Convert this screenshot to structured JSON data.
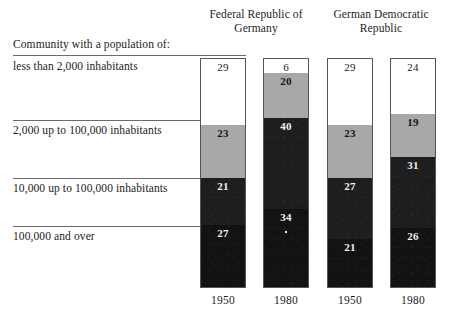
{
  "caption": "Community with a population of:",
  "group_headers": [
    "Federal Republic of\nGermany",
    "German Democratic\nRepublic"
  ],
  "group_headers_flat": [
    "Federal Republic of Germany",
    "German Democratic Republic"
  ],
  "row_labels": [
    "less than 2,000 inhabitants",
    "2,000 up to 100,000 inhabitants",
    "10,000 up to 100,000 inhabitants",
    "100,000 and over"
  ],
  "year_labels": [
    "1950",
    "1980",
    "1950",
    "1980"
  ],
  "colors": {
    "tone_white": "#ffffff",
    "tone_gray": "#a8a8a8",
    "tone_dark": "#1e1e1e",
    "tone_black": "#121212",
    "rule": "#6b6b6b",
    "bar_border": "#555555",
    "text": "#1c1c1c",
    "background": "#ffffff"
  },
  "chart_data": {
    "type": "bar",
    "title": "",
    "subtitle": "",
    "xlabel": "",
    "ylabel": "",
    "ylim": [
      0,
      100
    ],
    "grid": false,
    "legend_position": "row-labels-left",
    "stacked": true,
    "units": "percent",
    "categories": [
      "1950",
      "1980",
      "1950",
      "1980"
    ],
    "group_labels": [
      "Federal Republic of Germany",
      "German Democratic Republic"
    ],
    "group_spans": [
      {
        "label": "Federal Republic of Germany",
        "categories": [
          "1950",
          "1980"
        ]
      },
      {
        "label": "German Democratic Republic",
        "categories": [
          "1950",
          "1980"
        ]
      }
    ],
    "series": [
      {
        "name": "less than 2,000 inhabitants",
        "tone": "tone-white",
        "values": [
          29,
          6,
          29,
          24
        ]
      },
      {
        "name": "2,000 up to 100,000 inhabitants",
        "tone": "tone-gray",
        "values": [
          23,
          20,
          23,
          19
        ]
      },
      {
        "name": "10,000 up to 100,000 inhabitants",
        "tone": "tone-dark",
        "values": [
          21,
          40,
          27,
          31
        ]
      },
      {
        "name": "100,000 and over",
        "tone": "tone-black",
        "values": [
          27,
          34,
          21,
          26
        ]
      }
    ],
    "column_totals": [
      100,
      100,
      100,
      100
    ]
  },
  "bars": [
    {
      "year": "1950",
      "group": "Federal Republic of Germany",
      "segments": [
        {
          "label": "less than 2,000 inhabitants",
          "value": 29,
          "tone": "tone-white"
        },
        {
          "label": "2,000 up to 100,000 inhabitants",
          "value": 23,
          "tone": "tone-gray"
        },
        {
          "label": "10,000 up to 100,000 inhabitants",
          "value": 21,
          "tone": "tone-dark"
        },
        {
          "label": "100,000 and over",
          "value": 27,
          "tone": "tone-black"
        }
      ]
    },
    {
      "year": "1980",
      "group": "Federal Republic of Germany",
      "segments": [
        {
          "label": "less than 2,000 inhabitants",
          "value": 6,
          "tone": "tone-white"
        },
        {
          "label": "2,000 up to 100,000 inhabitants",
          "value": 20,
          "tone": "tone-gray"
        },
        {
          "label": "10,000 up to 100,000 inhabitants",
          "value": 40,
          "tone": "tone-dark"
        },
        {
          "label": "100,000 and over",
          "value": 34,
          "tone": "tone-black"
        }
      ]
    },
    {
      "year": "1950",
      "group": "German Democratic Republic",
      "segments": [
        {
          "label": "less than 2,000 inhabitants",
          "value": 29,
          "tone": "tone-white"
        },
        {
          "label": "2,000 up to 100,000 inhabitants",
          "value": 23,
          "tone": "tone-gray"
        },
        {
          "label": "10,000 up to 100,000 inhabitants",
          "value": 27,
          "tone": "tone-dark"
        },
        {
          "label": "100,000 and over",
          "value": 21,
          "tone": "tone-black"
        }
      ]
    },
    {
      "year": "1980",
      "group": "German Democratic Republic",
      "segments": [
        {
          "label": "less than 2,000 inhabitants",
          "value": 24,
          "tone": "tone-white"
        },
        {
          "label": "2,000 up to 100,000 inhabitants",
          "value": 19,
          "tone": "tone-gray"
        },
        {
          "label": "10,000 up to 100,000 inhabitants",
          "value": 31,
          "tone": "tone-dark"
        },
        {
          "label": "100,000 and over",
          "value": 26,
          "tone": "tone-black"
        }
      ]
    }
  ]
}
